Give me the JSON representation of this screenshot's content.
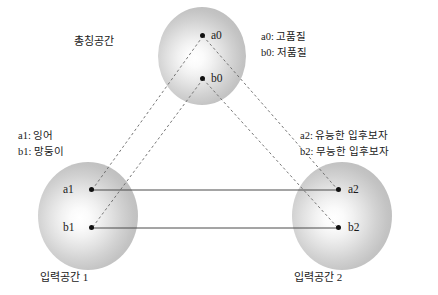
{
  "diagram": {
    "background_color": "#ffffff",
    "line_color": "#555555",
    "dot_color": "#111111",
    "sphere_fill": "#c8c8c8"
  },
  "spaces": [
    {
      "id": "generic",
      "label": "총칭공간",
      "nodes": [
        {
          "id": "a0",
          "label": "a0"
        },
        {
          "id": "b0",
          "label": "b0"
        }
      ]
    },
    {
      "id": "input1",
      "label": "입력공간 1",
      "nodes": [
        {
          "id": "a1",
          "label": "a1"
        },
        {
          "id": "b1",
          "label": "b1"
        }
      ]
    },
    {
      "id": "input2",
      "label": "입력공간 2",
      "nodes": [
        {
          "id": "a2",
          "label": "a2"
        },
        {
          "id": "b2",
          "label": "b2"
        }
      ]
    }
  ],
  "legends": {
    "generic": [
      "a0: 고품질",
      "b0: 저품질"
    ],
    "input1": [
      "a1: 잉어",
      "b1: 망둥이"
    ],
    "input2": [
      "a2: 유능한 입후보자",
      "b2: 무능한 입후보자"
    ]
  },
  "connections": {
    "dashed": [
      {
        "from": "a0",
        "to": "a1"
      },
      {
        "from": "a0",
        "to": "a2"
      },
      {
        "from": "b0",
        "to": "b1"
      },
      {
        "from": "b0",
        "to": "b2"
      }
    ],
    "solid": [
      {
        "from": "a1",
        "to": "a2"
      },
      {
        "from": "b1",
        "to": "b2"
      }
    ]
  }
}
